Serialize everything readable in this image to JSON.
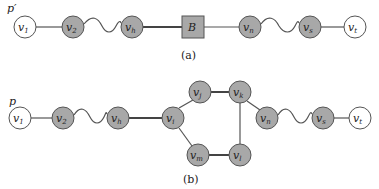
{
  "diagram_a": {
    "path_label": "p′",
    "caption": "(a)",
    "nodes": [
      {
        "id": "v1",
        "base": "v",
        "sub": "1",
        "x": 25,
        "y": 27,
        "fill": "white",
        "shape": "circle"
      },
      {
        "id": "v2",
        "base": "v",
        "sub": "2",
        "x": 73,
        "y": 27,
        "fill": "gray",
        "shape": "circle"
      },
      {
        "id": "vh",
        "base": "v",
        "sub": "h",
        "x": 132,
        "y": 27,
        "fill": "gray",
        "shape": "circle"
      },
      {
        "id": "B",
        "base": "B",
        "sub": "",
        "x": 193,
        "y": 27,
        "fill": "gray",
        "shape": "square"
      },
      {
        "id": "vn",
        "base": "v",
        "sub": "n",
        "x": 250,
        "y": 27,
        "fill": "gray",
        "shape": "circle"
      },
      {
        "id": "vs",
        "base": "v",
        "sub": "s",
        "x": 310,
        "y": 27,
        "fill": "gray",
        "shape": "circle"
      },
      {
        "id": "vt",
        "base": "v",
        "sub": "t",
        "x": 355,
        "y": 27,
        "fill": "white",
        "shape": "circle"
      }
    ],
    "edges": [
      {
        "from": "v1",
        "to": "v2",
        "style": "straight"
      },
      {
        "from": "v2",
        "to": "vh",
        "style": "wavy"
      },
      {
        "from": "vh",
        "to": "B",
        "style": "bold"
      },
      {
        "from": "B",
        "to": "vn",
        "style": "straight"
      },
      {
        "from": "vn",
        "to": "vs",
        "style": "wavy"
      },
      {
        "from": "vs",
        "to": "vt",
        "style": "straight"
      }
    ]
  },
  "diagram_b": {
    "path_label": "p",
    "caption": "(b)",
    "nodes": [
      {
        "id": "v1",
        "base": "v",
        "sub": "1",
        "x": 20,
        "y": 118,
        "fill": "white"
      },
      {
        "id": "v2",
        "base": "v",
        "sub": "2",
        "x": 63,
        "y": 118,
        "fill": "gray"
      },
      {
        "id": "vh",
        "base": "v",
        "sub": "h",
        "x": 118,
        "y": 118,
        "fill": "gray"
      },
      {
        "id": "vi",
        "base": "v",
        "sub": "i",
        "x": 173,
        "y": 118,
        "fill": "gray"
      },
      {
        "id": "vj",
        "base": "v",
        "sub": "j",
        "x": 200,
        "y": 92,
        "fill": "gray"
      },
      {
        "id": "vk",
        "base": "v",
        "sub": "k",
        "x": 240,
        "y": 92,
        "fill": "gray"
      },
      {
        "id": "vm",
        "base": "v",
        "sub": "m",
        "x": 198,
        "y": 155,
        "fill": "gray"
      },
      {
        "id": "vl",
        "base": "v",
        "sub": "l",
        "x": 240,
        "y": 155,
        "fill": "gray"
      },
      {
        "id": "vn",
        "base": "v",
        "sub": "n",
        "x": 267,
        "y": 118,
        "fill": "gray"
      },
      {
        "id": "vs",
        "base": "v",
        "sub": "s",
        "x": 323,
        "y": 118,
        "fill": "gray"
      },
      {
        "id": "vt",
        "base": "v",
        "sub": "t",
        "x": 360,
        "y": 118,
        "fill": "white"
      }
    ],
    "edges": [
      {
        "from": "v1",
        "to": "v2",
        "style": "straight"
      },
      {
        "from": "v2",
        "to": "vh",
        "style": "wavy"
      },
      {
        "from": "vh",
        "to": "vi",
        "style": "bold"
      },
      {
        "from": "vi",
        "to": "vj",
        "style": "straight"
      },
      {
        "from": "vj",
        "to": "vk",
        "style": "bold"
      },
      {
        "from": "vk",
        "to": "vl",
        "style": "straight"
      },
      {
        "from": "vk",
        "to": "vn",
        "style": "straight"
      },
      {
        "from": "vi",
        "to": "vm",
        "style": "straight"
      },
      {
        "from": "vm",
        "to": "vl",
        "style": "bold"
      },
      {
        "from": "vn",
        "to": "vs",
        "style": "wavy"
      },
      {
        "from": "vs",
        "to": "vt",
        "style": "straight"
      }
    ]
  },
  "colors": {
    "node_gray": "#a8a8a8",
    "node_white": "#ffffff",
    "stroke": "#555555"
  }
}
